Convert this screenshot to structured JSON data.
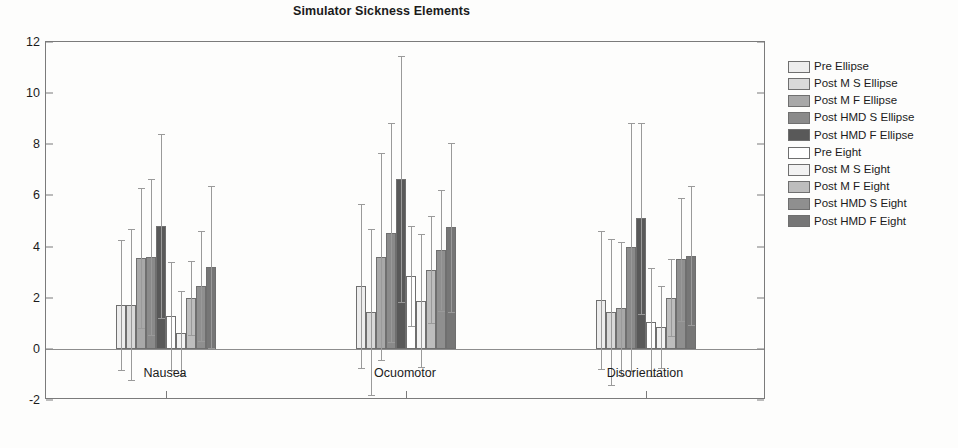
{
  "chart_data": {
    "type": "bar",
    "title": "Simulator Sickness Elements",
    "xlabel": "",
    "ylabel": "",
    "categories": [
      "Nausea",
      "Ocuomotor",
      "Disorientation"
    ],
    "ylim": [
      -2,
      12
    ],
    "yticks": [
      -2,
      0,
      2,
      4,
      6,
      8,
      10,
      12
    ],
    "grid": false,
    "legend_position": "right",
    "error_bars": "std",
    "series": [
      {
        "name": "Pre Ellipse",
        "color": "#ededed",
        "values": [
          1.72,
          2.45,
          1.9
        ],
        "errors": [
          2.55,
          3.2,
          2.7
        ]
      },
      {
        "name": "Post M S Ellipse",
        "color": "#d9d9d9",
        "values": [
          1.72,
          1.45,
          1.45
        ],
        "errors": [
          2.95,
          3.25,
          2.85
        ]
      },
      {
        "name": "Post M F Ellipse",
        "color": "#a8a8a8",
        "values": [
          3.55,
          3.6,
          1.58
        ],
        "errors": [
          2.75,
          4.05,
          2.6
        ]
      },
      {
        "name": "Post HMD S Ellipse",
        "color": "#8a8a8a",
        "values": [
          3.6,
          4.55,
          4.0
        ],
        "errors": [
          3.05,
          4.3,
          4.85
        ]
      },
      {
        "name": "Post HMD F Ellipse",
        "color": "#595959",
        "values": [
          4.8,
          6.65,
          5.1
        ],
        "errors": [
          3.6,
          4.8,
          3.75
        ]
      },
      {
        "name": "Pre Eight",
        "color": "#ffffff",
        "values": [
          1.28,
          2.85,
          1.05
        ],
        "errors": [
          2.1,
          1.95,
          2.1
        ]
      },
      {
        "name": "Post M S Eight",
        "color": "#f2f2f2",
        "values": [
          0.62,
          1.88,
          0.85
        ],
        "errors": [
          1.65,
          2.6,
          1.6
        ]
      },
      {
        "name": "Post M F Eight",
        "color": "#bdbdbd",
        "values": [
          2.0,
          3.1,
          2.0
        ],
        "errors": [
          1.45,
          2.1,
          1.5
        ]
      },
      {
        "name": "Post HMD S Eight",
        "color": "#8f8f8f",
        "values": [
          2.45,
          3.85,
          3.5
        ],
        "errors": [
          2.15,
          2.35,
          2.4
        ]
      },
      {
        "name": "Post HMD F Eight",
        "color": "#767676",
        "values": [
          3.2,
          4.75,
          3.65
        ],
        "errors": [
          3.15,
          3.3,
          2.7
        ]
      }
    ]
  },
  "legend": {
    "items": [
      {
        "label": "Pre Ellipse",
        "color": "#ededed"
      },
      {
        "label": "Post M S Ellipse",
        "color": "#d9d9d9"
      },
      {
        "label": "Post M F Ellipse",
        "color": "#a8a8a8"
      },
      {
        "label": "Post HMD S Ellipse",
        "color": "#8a8a8a"
      },
      {
        "label": "Post HMD F Ellipse",
        "color": "#595959"
      },
      {
        "label": "Pre Eight",
        "color": "#ffffff"
      },
      {
        "label": "Post M S Eight",
        "color": "#f2f2f2"
      },
      {
        "label": "Post M F Eight",
        "color": "#bdbdbd"
      },
      {
        "label": "Post HMD S Eight",
        "color": "#8f8f8f"
      },
      {
        "label": "Post HMD F Eight",
        "color": "#767676"
      }
    ]
  }
}
